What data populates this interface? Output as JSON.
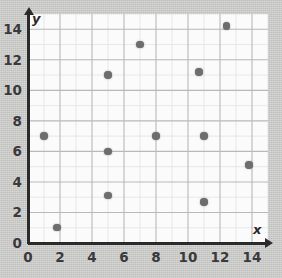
{
  "figure": {
    "kind": "scatter-plot",
    "axis_color": "#2b2b2b",
    "point_color": "#6d6d6d",
    "panel_color": "#fbfbfb",
    "background_color": "#cbcbca"
  },
  "axes": {
    "x_name": "x",
    "y_name": "y",
    "origin_label": "0"
  },
  "chart_data": {
    "type": "scatter",
    "title": "",
    "xlabel": "x",
    "ylabel": "y",
    "xlim": [
      0,
      15
    ],
    "ylim": [
      0,
      15
    ],
    "grid": true,
    "grid_minor_step": 1,
    "grid_major_step": 2,
    "legend": null,
    "xticks": [
      0,
      2,
      4,
      6,
      8,
      10,
      12,
      14
    ],
    "yticks": [
      0,
      2,
      4,
      6,
      8,
      10,
      12,
      14
    ],
    "xtick_labels": [
      "0",
      "2",
      "4",
      "6",
      "8",
      "10",
      "12",
      "14"
    ],
    "ytick_labels": [
      "0",
      "2",
      "4",
      "6",
      "8",
      "10",
      "12",
      "14"
    ],
    "points": [
      {
        "x": 1.0,
        "y": 7.0
      },
      {
        "x": 1.8,
        "y": 1.0
      },
      {
        "x": 5.0,
        "y": 11.0
      },
      {
        "x": 5.0,
        "y": 6.0
      },
      {
        "x": 5.0,
        "y": 3.1
      },
      {
        "x": 7.0,
        "y": 13.0
      },
      {
        "x": 8.0,
        "y": 7.0
      },
      {
        "x": 10.7,
        "y": 11.2
      },
      {
        "x": 11.0,
        "y": 7.0
      },
      {
        "x": 11.0,
        "y": 2.7
      },
      {
        "x": 12.4,
        "y": 14.2
      },
      {
        "x": 13.8,
        "y": 5.1
      }
    ]
  }
}
